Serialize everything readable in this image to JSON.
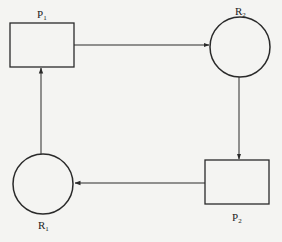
{
  "diagram": {
    "type": "resource-allocation-graph",
    "nodes": [
      {
        "id": "P1",
        "kind": "process",
        "shape": "rectangle",
        "label": "P",
        "subscript": "1"
      },
      {
        "id": "R2",
        "kind": "resource",
        "shape": "circle",
        "label": "R",
        "subscript": "2"
      },
      {
        "id": "P2",
        "kind": "process",
        "shape": "rectangle",
        "label": "P",
        "subscript": "2"
      },
      {
        "id": "R1",
        "kind": "resource",
        "shape": "circle",
        "label": "R",
        "subscript": "1"
      }
    ],
    "edges": [
      {
        "from": "P1",
        "to": "R2"
      },
      {
        "from": "R2",
        "to": "P2"
      },
      {
        "from": "P2",
        "to": "R1"
      },
      {
        "from": "R1",
        "to": "P1"
      }
    ],
    "colors": {
      "stroke": "#2a2a2a",
      "background": "#f4f4f2"
    }
  }
}
